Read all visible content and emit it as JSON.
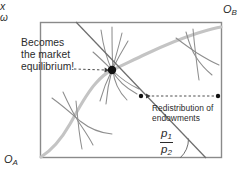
{
  "figure": {
    "type": "edgeworth-box-diagram",
    "canvas": {
      "width": 252,
      "height": 176
    },
    "box": {
      "left": 40,
      "top": 22,
      "right": 222,
      "bottom": 158
    },
    "colors": {
      "background": "#ffffff",
      "box_border": "#8a8a8a",
      "contract_curve": "#bdbdbd",
      "indifference_curve": "#8e8e8e",
      "budget_line": "#6e6e6e",
      "dashed_arrow": "#3a3a3a",
      "point_fill": "#111111",
      "text": "#2b2b2b"
    },
    "annotations": {
      "becomes_equilibrium": "Becomes\nthe market\nequilibrium!",
      "redistribution": "Redistribution of\nendowments",
      "origin_a": "O",
      "origin_a_sub": "A",
      "origin_b": "O",
      "origin_b_sub": "B",
      "allocation_x": "x",
      "endowment_omega": "ω",
      "price_ratio_numerator": "p",
      "price_ratio_numerator_sub": "1",
      "price_ratio_denominator": "p",
      "price_ratio_denominator_sub": "2"
    },
    "points": {
      "equilibrium_x": {
        "x": 112,
        "y": 70,
        "label": "x",
        "radius": 4.2
      },
      "new_endowment": {
        "x": 140,
        "y": 96,
        "radius": 2.2
      },
      "old_endowment_omega": {
        "x": 218,
        "y": 96,
        "radius": 2.2,
        "label": "ω"
      }
    },
    "budget_line": {
      "from": {
        "x": 76,
        "y": 22
      },
      "to": {
        "x": 206,
        "y": 158
      },
      "slope_label": "p1/p2"
    },
    "arrows": {
      "text_to_equilibrium": {
        "from": {
          "x": 74,
          "y": 69
        },
        "to": {
          "x": 106,
          "y": 70
        },
        "style": "dashed"
      },
      "omega_to_new_endowment": {
        "from": {
          "x": 214,
          "y": 96
        },
        "to": {
          "x": 145,
          "y": 96
        },
        "style": "dashed"
      }
    },
    "angle_arc": {
      "vertex": {
        "x": 206,
        "y": 158
      },
      "radius": 26
    }
  }
}
